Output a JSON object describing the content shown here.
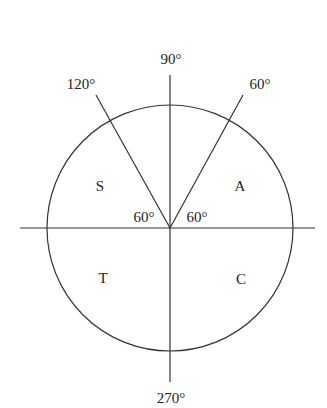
{
  "diagram": {
    "center": [
      170,
      228
    ],
    "radius": 123,
    "axis_labels": {
      "top": "90°",
      "bottom": "270°"
    },
    "ray_labels": {
      "left": "120°",
      "right": "60°"
    },
    "angle_labels": {
      "left": "60°",
      "right": "60°"
    },
    "quadrants": {
      "second": "S",
      "first": "A",
      "third": "T",
      "fourth": "C"
    }
  }
}
